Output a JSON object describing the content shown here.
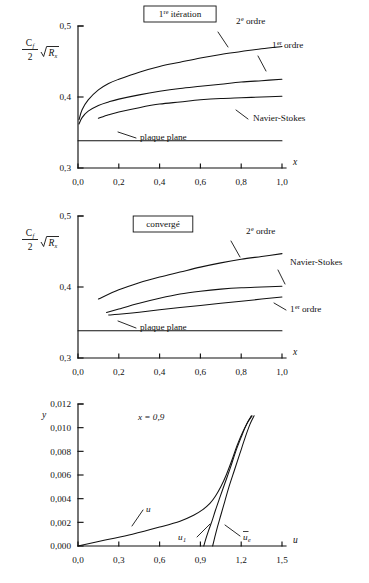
{
  "figure": {
    "background": "#ffffff",
    "ink": "#111111"
  },
  "charts": [
    {
      "id": "chart-first-iteration",
      "title": "1re itération",
      "title_base": "1",
      "title_sup": "re",
      "title_rest": " itération",
      "boxed_title": true,
      "ylabel_num": "C",
      "ylabel_num_sub": "f",
      "ylabel_den": "2",
      "ylabel_radical": "R",
      "ylabel_radical_sub": "x",
      "xlabel": "x",
      "xticks": [
        "0,0",
        "0,2",
        "0,4",
        "0,6",
        "0,8",
        "1,0"
      ],
      "xtick_values": [
        0.0,
        0.2,
        0.4,
        0.6,
        0.8,
        1.0
      ],
      "yticks": [
        "0,3",
        "0,4",
        "0,5"
      ],
      "ytick_values": [
        0.3,
        0.4,
        0.5
      ],
      "xlim": [
        0.0,
        1.0
      ],
      "ylim": [
        0.3,
        0.5
      ],
      "annotations": [
        {
          "name": "second-order",
          "base": "2",
          "sup": "e",
          "rest": " ordre"
        },
        {
          "name": "first-order",
          "base": "1",
          "sup": "er",
          "rest": " ordre"
        },
        {
          "name": "navier-stokes",
          "base": "Navier-Stokes",
          "sup": "",
          "rest": ""
        },
        {
          "name": "flat-plate",
          "base": "plaque plane",
          "sup": "",
          "rest": ""
        }
      ]
    },
    {
      "id": "chart-converged",
      "title": "convergé",
      "title_base": "convergé",
      "title_sup": "",
      "title_rest": "",
      "boxed_title": true,
      "ylabel_num": "C",
      "ylabel_num_sub": "f",
      "ylabel_den": "2",
      "ylabel_radical": "R",
      "ylabel_radical_sub": "x",
      "xlabel": "x",
      "xticks": [
        "0,0",
        "0,2",
        "0,4",
        "0,6",
        "0,8",
        "1,0"
      ],
      "xtick_values": [
        0.0,
        0.2,
        0.4,
        0.6,
        0.8,
        1.0
      ],
      "yticks": [
        "0,3",
        "0,4",
        "0,5"
      ],
      "ytick_values": [
        0.3,
        0.4,
        0.5
      ],
      "xlim": [
        0.0,
        1.0
      ],
      "ylim": [
        0.3,
        0.5
      ],
      "annotations": [
        {
          "name": "second-order",
          "base": "2",
          "sup": "e",
          "rest": " ordre"
        },
        {
          "name": "navier-stokes",
          "base": "Navier-Stokes",
          "sup": "",
          "rest": ""
        },
        {
          "name": "first-order",
          "base": "1",
          "sup": "er",
          "rest": " ordre"
        },
        {
          "name": "flat-plate",
          "base": "plaque plane",
          "sup": "",
          "rest": ""
        }
      ]
    },
    {
      "id": "chart-velocity-profile",
      "title": "x = 0,9",
      "title_base": "x",
      "title_sup": "",
      "title_rest": " = 0,9",
      "boxed_title": false,
      "ylabel_plain": "y",
      "xlabel": "u",
      "xticks": [
        "0,0",
        "0,3",
        "0,6",
        "0,9",
        "1,2",
        "1,5"
      ],
      "xtick_values": [
        0.0,
        0.3,
        0.6,
        0.9,
        1.2,
        1.5
      ],
      "yticks": [
        "0,000",
        "0,002",
        "0,004",
        "0,006",
        "0,008",
        "0,010",
        "0,012"
      ],
      "ytick_values": [
        0.0,
        0.002,
        0.004,
        0.006,
        0.008,
        0.01,
        0.012
      ],
      "xlim": [
        0.0,
        1.5
      ],
      "ylim": [
        0.0,
        0.012
      ],
      "annotations": [
        {
          "name": "u-curve",
          "base": "u",
          "sub": "",
          "bar": false
        },
        {
          "name": "u1-curve",
          "base": "u",
          "sub": "1",
          "bar": false
        },
        {
          "name": "ue-curve",
          "base": "u",
          "sub": "e",
          "bar": true
        }
      ]
    }
  ],
  "chart_data": [
    {
      "type": "line",
      "title": "1re itération",
      "xlabel": "x",
      "ylabel": "Cf/2 sqrt(Rx)",
      "xlim": [
        0.0,
        1.0
      ],
      "ylim": [
        0.3,
        0.5
      ],
      "xticks": [
        0.0,
        0.2,
        0.4,
        0.6,
        0.8,
        1.0
      ],
      "yticks": [
        0.3,
        0.4,
        0.5
      ],
      "grid": false,
      "legend": "inline-annotations",
      "series": [
        {
          "name": "2e ordre",
          "x": [
            0.005,
            0.02,
            0.05,
            0.1,
            0.15,
            0.2,
            0.3,
            0.4,
            0.5,
            0.6,
            0.7,
            0.8,
            0.9,
            1.0
          ],
          "y": [
            0.368,
            0.382,
            0.396,
            0.41,
            0.419,
            0.425,
            0.435,
            0.443,
            0.449,
            0.455,
            0.46,
            0.464,
            0.468,
            0.471
          ]
        },
        {
          "name": "1er ordre",
          "x": [
            0.005,
            0.02,
            0.05,
            0.1,
            0.15,
            0.2,
            0.3,
            0.4,
            0.5,
            0.6,
            0.7,
            0.8,
            0.9,
            1.0
          ],
          "y": [
            0.362,
            0.371,
            0.38,
            0.388,
            0.393,
            0.397,
            0.403,
            0.408,
            0.412,
            0.415,
            0.418,
            0.421,
            0.423,
            0.425
          ]
        },
        {
          "name": "Navier-Stokes",
          "x": [
            0.1,
            0.15,
            0.2,
            0.3,
            0.4,
            0.5,
            0.6,
            0.7,
            0.8,
            0.9,
            1.0
          ],
          "y": [
            0.37,
            0.375,
            0.379,
            0.385,
            0.39,
            0.393,
            0.396,
            0.398,
            0.399,
            0.4,
            0.401
          ]
        },
        {
          "name": "plaque plane",
          "x": [
            0.0,
            1.0
          ],
          "y": [
            0.3385,
            0.3385
          ]
        }
      ]
    },
    {
      "type": "line",
      "title": "convergé",
      "xlabel": "x",
      "ylabel": "Cf/2 sqrt(Rx)",
      "xlim": [
        0.0,
        1.0
      ],
      "ylim": [
        0.3,
        0.5
      ],
      "xticks": [
        0.0,
        0.2,
        0.4,
        0.6,
        0.8,
        1.0
      ],
      "yticks": [
        0.3,
        0.4,
        0.5
      ],
      "grid": false,
      "legend": "inline-annotations",
      "series": [
        {
          "name": "2e ordre",
          "x": [
            0.1,
            0.2,
            0.3,
            0.4,
            0.5,
            0.6,
            0.7,
            0.8,
            0.9,
            1.0
          ],
          "y": [
            0.383,
            0.396,
            0.406,
            0.414,
            0.421,
            0.428,
            0.434,
            0.439,
            0.443,
            0.447
          ]
        },
        {
          "name": "Navier-Stokes",
          "x": [
            0.14,
            0.2,
            0.3,
            0.4,
            0.5,
            0.6,
            0.7,
            0.8,
            0.9,
            1.0
          ],
          "y": [
            0.364,
            0.369,
            0.377,
            0.384,
            0.39,
            0.394,
            0.397,
            0.399,
            0.4,
            0.401
          ]
        },
        {
          "name": "1er ordre",
          "x": [
            0.15,
            0.2,
            0.3,
            0.4,
            0.5,
            0.6,
            0.7,
            0.8,
            0.9,
            1.0
          ],
          "y": [
            0.3605,
            0.3615,
            0.3645,
            0.368,
            0.371,
            0.374,
            0.377,
            0.38,
            0.383,
            0.386
          ]
        },
        {
          "name": "plaque plane",
          "x": [
            0.0,
            1.0
          ],
          "y": [
            0.3385,
            0.3385
          ]
        }
      ]
    },
    {
      "type": "line",
      "title": "x = 0,9",
      "xlabel": "u",
      "ylabel": "y",
      "xlim": [
        0.0,
        1.5
      ],
      "ylim": [
        0.0,
        0.012
      ],
      "xticks": [
        0.0,
        0.3,
        0.6,
        0.9,
        1.2,
        1.5
      ],
      "yticks": [
        0.0,
        0.002,
        0.004,
        0.006,
        0.008,
        0.01,
        0.012
      ],
      "grid": false,
      "legend": "inline-annotations",
      "series": [
        {
          "name": "u",
          "x": [
            0.0,
            0.2,
            0.4,
            0.6,
            0.75,
            0.85,
            0.92,
            0.97,
            1.01,
            1.05,
            1.09,
            1.13,
            1.17,
            1.21,
            1.25,
            1.28
          ],
          "y": [
            0.0,
            0.0005,
            0.001,
            0.0016,
            0.0021,
            0.0026,
            0.0031,
            0.0036,
            0.0042,
            0.005,
            0.006,
            0.0072,
            0.0085,
            0.0096,
            0.0105,
            0.011
          ]
        },
        {
          "name": "u1",
          "x": [
            0.925,
            0.94,
            0.96,
            0.985,
            1.01,
            1.04,
            1.08,
            1.12,
            1.16,
            1.2,
            1.24,
            1.275
          ],
          "y": [
            0.0,
            0.0006,
            0.0013,
            0.0021,
            0.003,
            0.004,
            0.0053,
            0.0066,
            0.008,
            0.0092,
            0.0103,
            0.011
          ]
        },
        {
          "name": "ue",
          "x": [
            0.99,
            1.005,
            1.025,
            1.05,
            1.08,
            1.11,
            1.15,
            1.19,
            1.23,
            1.265,
            1.295
          ],
          "y": [
            0.0,
            0.0007,
            0.0016,
            0.0026,
            0.0038,
            0.005,
            0.0064,
            0.0078,
            0.0092,
            0.0103,
            0.011
          ]
        }
      ]
    }
  ]
}
